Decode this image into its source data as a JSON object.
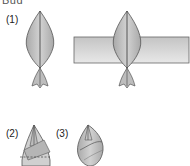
{
  "title": "Bud",
  "steps": [
    {
      "label": "(1)"
    },
    {
      "label": "(2)"
    },
    {
      "label": "(3)"
    }
  ],
  "colors": {
    "petal_fill": "#b8b8b8",
    "petal_light": "#d4d4d4",
    "band_fill": "#d6d6d6",
    "outline": "#555555",
    "ink": "#222222"
  }
}
